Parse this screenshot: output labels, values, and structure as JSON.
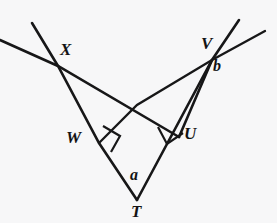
{
  "figure": {
    "type": "geometry-diagram",
    "background_color": "#f7f7f8",
    "stroke_color": "#171718",
    "labels": {
      "x": "X",
      "v": "V",
      "b": "b",
      "w": "W",
      "u": "U",
      "a": "a",
      "t": "T"
    },
    "watermark": "",
    "points": {
      "X": {
        "x": 58,
        "y": 66
      },
      "V": {
        "x": 212,
        "y": 60
      },
      "T": {
        "x": 137,
        "y": 200
      },
      "W": {
        "x": 99,
        "y": 143
      },
      "U": {
        "x": 179,
        "y": 137
      },
      "C": {
        "x": 137,
        "y": 105
      },
      "X_ray_up": {
        "x": 32,
        "y": 24
      },
      "X_ray_left": {
        "x": 0,
        "y": 41
      },
      "V_ray_up_steep": {
        "x": 239,
        "y": 21
      },
      "V_ray_up_shallow": {
        "x": 264,
        "y": 31
      }
    },
    "segments": [
      {
        "name": "ray-through-X-upper-left",
        "from": "X_ray_up",
        "to": "X"
      },
      {
        "name": "segment-X-to-T",
        "from": "X",
        "to": "T"
      },
      {
        "name": "ray-left-edge-through-X",
        "from": "X_ray_left",
        "to": "X"
      },
      {
        "name": "segment-X-to-U",
        "from": "X",
        "to": "U"
      },
      {
        "name": "segment-U-to-V",
        "from": "U",
        "to": "V"
      },
      {
        "name": "ray-V-up-steep",
        "from": "V",
        "to": "V_ray_up_steep"
      },
      {
        "name": "ray-V-up-shallow",
        "from": "V",
        "to": "V_ray_up_shallow"
      },
      {
        "name": "segment-V-to-T",
        "from": "V",
        "to": "T"
      },
      {
        "name": "segment-T-to-W-extended",
        "from": "T",
        "to": "W"
      }
    ],
    "right_angles": [
      {
        "name": "right-angle-at-W",
        "vertex": "W"
      },
      {
        "name": "right-angle-at-U",
        "vertex": "U"
      }
    ]
  }
}
